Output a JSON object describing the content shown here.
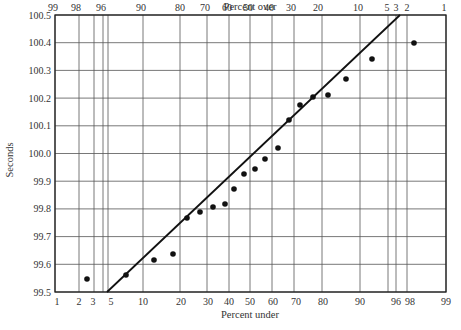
{
  "chart_data": {
    "type": "scatter",
    "subtype": "normal-probability-plot",
    "title": "",
    "xlabel_bottom": "Percent under",
    "xlabel_top": "Percent over",
    "ylabel": "Seconds",
    "ylim": [
      99.5,
      100.5
    ],
    "y_ticks": [
      "100.5",
      "100.4",
      "100.3",
      "100.2",
      "100.1",
      "100.0",
      "99.9",
      "99.8",
      "99.7",
      "99.6",
      "99.5"
    ],
    "x_ticks_bottom": [
      "1",
      "2",
      "3",
      "5",
      "10",
      "20",
      "30",
      "40",
      "50",
      "60",
      "70",
      "80",
      "90",
      "96",
      "98",
      "99"
    ],
    "x_ticks_top": [
      "99",
      "98",
      "96",
      "90",
      "80",
      "70",
      "60",
      "50",
      "40",
      "30",
      "20",
      "10",
      "5",
      "3",
      "2",
      "1"
    ],
    "grid": true,
    "series": [
      {
        "name": "observations",
        "percent_under": [
          2.5,
          7.5,
          12.5,
          17.5,
          22.5,
          27.5,
          32.5,
          37.5,
          42.5,
          47.5,
          52.5,
          57.5,
          62.5,
          67.5,
          72.5,
          77.5,
          82.5,
          87.5,
          92.5,
          97.5
        ],
        "values": [
          99.55,
          99.57,
          99.62,
          99.65,
          99.79,
          99.82,
          99.83,
          99.85,
          99.91,
          99.97,
          99.99,
          100.03,
          100.07,
          100.18,
          100.24,
          100.27,
          100.28,
          100.34,
          100.42,
          100.49
        ]
      }
    ],
    "fit_line": {
      "start": {
        "percent_under": 4.5,
        "value": 99.5
      },
      "end": {
        "percent_under": 96.5,
        "value": 100.5
      }
    }
  },
  "layout": {
    "plot": {
      "left": 55,
      "right": 446,
      "top": 15,
      "bottom": 292
    },
    "x_grid_px": [
      55,
      79,
      94,
      103,
      108,
      143,
      180,
      207,
      229,
      250,
      272,
      294,
      322,
      360,
      388,
      396,
      407,
      446
    ],
    "x_bottom_label_px": {
      "1": 57,
      "2": 79,
      "3": 93,
      "5": 111,
      "10": 143,
      "20": 181,
      "30": 208,
      "40": 229,
      "50": 250,
      "60": 273,
      "70": 296,
      "80": 323,
      "90": 360,
      "96": 396,
      "98": 410,
      "99": 446
    },
    "x_top_label_px": {
      "99": 53,
      "98": 76,
      "96": 101,
      "90": 141,
      "80": 180,
      "70": 205,
      "60": 227,
      "50": 248,
      "40": 269,
      "30": 291,
      "20": 318,
      "10": 358,
      "5": 387,
      "3": 396,
      "2": 407,
      "1": 444
    },
    "points_px": [
      [
        87,
        279
      ],
      [
        126,
        275
      ],
      [
        154,
        260
      ],
      [
        173,
        254
      ],
      [
        187,
        218
      ],
      [
        200,
        212
      ],
      [
        213,
        207
      ],
      [
        225,
        204
      ],
      [
        234,
        189
      ],
      [
        244,
        174
      ],
      [
        255,
        169
      ],
      [
        265,
        159
      ],
      [
        278,
        148
      ],
      [
        289,
        120
      ],
      [
        300,
        105
      ],
      [
        313,
        97
      ],
      [
        328,
        95
      ],
      [
        346,
        79
      ],
      [
        372,
        59
      ],
      [
        414,
        43
      ]
    ],
    "line_px": [
      [
        107,
        292
      ],
      [
        400,
        15
      ]
    ]
  }
}
